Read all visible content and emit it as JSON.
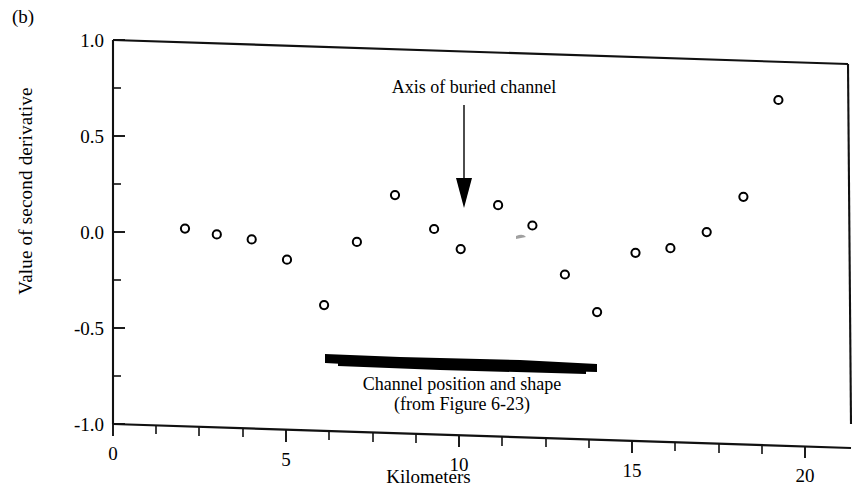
{
  "figure": {
    "panel_label": "(b)",
    "ylabel": "Value of second derivative",
    "xlabel": "Kilometers"
  },
  "annotations": {
    "axis_arrow_label": "Axis of buried channel",
    "channel_caption_line1": "Channel position and shape",
    "channel_caption_line2": "(from Figure 6-23)"
  },
  "ticks": {
    "y": [
      "1.0",
      "0.5",
      "0.0",
      "-0.5",
      "-1.0"
    ],
    "x": [
      "0",
      "5",
      "10",
      "15",
      "20"
    ]
  },
  "chart_data": {
    "type": "scatter",
    "title": "",
    "xlabel": "Kilometers",
    "ylabel": "Value of second derivative",
    "xlim": [
      0,
      21.3
    ],
    "ylim": [
      -1.0,
      1.0
    ],
    "xticks": [
      0,
      5,
      10,
      15,
      20
    ],
    "yticks": [
      -1.0,
      -0.5,
      0.0,
      0.5,
      1.0
    ],
    "xminor_step": 1.25,
    "yminor_step": 0.25,
    "grid": false,
    "legend": false,
    "marker": "open-circle",
    "series": [
      {
        "name": "Second derivative",
        "x": [
          2.08,
          3.0,
          4.01,
          5.03,
          6.1,
          7.05,
          8.15,
          9.28,
          10.05,
          11.13,
          12.12,
          13.06,
          13.99,
          15.1,
          16.11,
          17.16,
          18.22,
          19.23
        ],
        "y": [
          0.03,
          0.005,
          -0.015,
          -0.115,
          -0.345,
          -0.01,
          0.24,
          0.07,
          -0.03,
          0.205,
          0.105,
          -0.145,
          -0.335,
          -0.02,
          0.01,
          0.1,
          0.29,
          0.8
        ]
      }
    ],
    "annotations": [
      {
        "text": "Axis of buried channel",
        "arrow_from_x": 10.0,
        "arrow_from_y": 0.7,
        "arrow_to_x": 10.0,
        "arrow_to_y": 0.07
      },
      {
        "text": "Channel position and shape (from Figure 6-23)",
        "shape": "filled-bar",
        "x_start": 6.15,
        "x_end": 13.95,
        "y_level": -0.7
      }
    ]
  }
}
